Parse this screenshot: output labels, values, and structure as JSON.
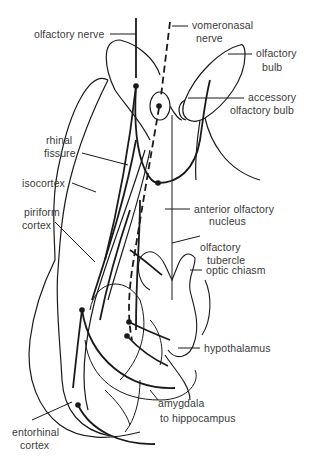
{
  "diagram": {
    "labels": {
      "olfactory_nerve": "olfactory nerve",
      "vomeronasal_line1": "vomeronasal",
      "vomeronasal_line2": "nerve",
      "olfactory_bulb_line1": "olfactory",
      "olfactory_bulb_line2": "bulb",
      "accessory_bulb_line1": "accessory",
      "accessory_bulb_line2": "olfactory bulb",
      "rhinal_fissure_line1": "rhinal",
      "rhinal_fissure_line2": "fissure",
      "isocortex": "isocortex",
      "piriform_line1": "piriform",
      "piriform_line2": "cortex",
      "anterior_nucleus_line1": "anterior olfactory",
      "anterior_nucleus_line2": "nucleus",
      "tubercle_line1": "olfactory",
      "tubercle_line2": "tubercle",
      "optic_chiasm": "optic chiasm",
      "hypothalamus": "hypothalamus",
      "amygdala": "amygdala",
      "to_hippocampus": "to hippocampus",
      "entorhinal_line1": "entorhinal",
      "entorhinal_line2": "cortex"
    },
    "colors": {
      "ink": "#1a1a1a",
      "text": "#3a3a3a",
      "background": "#ffffff"
    }
  }
}
